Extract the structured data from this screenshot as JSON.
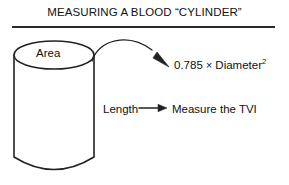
{
  "figure": {
    "title": "MEASURING A BLOOD “CYLINDER”",
    "background_color": "#ffffff",
    "stroke_color": "#222222",
    "text_color": "#111111"
  },
  "diagram": {
    "type": "cylinder-annotation-diagram",
    "shape": {
      "name": "cylinder",
      "label": "Area",
      "label_position": "top-ellipse"
    },
    "annotations": [
      {
        "name": "area-formula",
        "source": "Area",
        "connector": "curved-arrow",
        "text_prefix": "0.785 ",
        "text_operator": "×",
        "text_operand": " Diameter",
        "text_exponent": "2",
        "full_text": "0.785 × Diameter²"
      },
      {
        "name": "length-measure",
        "source": "Length",
        "connector": "straight-arrow",
        "target": "Measure the TVI"
      }
    ],
    "labels": {
      "area": "Area",
      "length": "Length",
      "tvi": "Measure the TVI"
    }
  }
}
